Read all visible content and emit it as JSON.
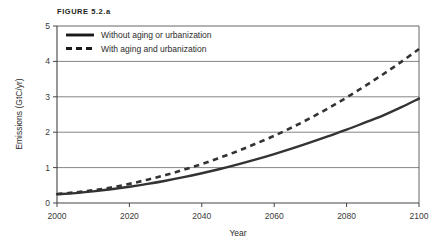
{
  "figure": {
    "title": "FIGURE 5.2.a"
  },
  "chart_data": {
    "type": "line",
    "title": "FIGURE 5.2.a",
    "xlabel": "Year",
    "ylabel": "Emissions (GtC/yr)",
    "xlim": [
      2000,
      2100
    ],
    "ylim": [
      0,
      5
    ],
    "xticks": [
      2000,
      2020,
      2040,
      2060,
      2080,
      2100
    ],
    "yticks": [
      0,
      1,
      2,
      3,
      4,
      5
    ],
    "grid": "horizontal",
    "legend_position": "top-left-inside",
    "series": [
      {
        "name": "Without aging or urbanization",
        "style": "solid",
        "color": "#333333",
        "x": [
          2000,
          2005,
          2010,
          2015,
          2020,
          2025,
          2030,
          2035,
          2040,
          2045,
          2050,
          2055,
          2060,
          2065,
          2070,
          2075,
          2080,
          2085,
          2090,
          2095,
          2100
        ],
        "values": [
          0.25,
          0.28,
          0.33,
          0.39,
          0.46,
          0.54,
          0.63,
          0.73,
          0.84,
          0.96,
          1.09,
          1.23,
          1.38,
          1.54,
          1.71,
          1.89,
          2.07,
          2.27,
          2.47,
          2.7,
          2.95
        ]
      },
      {
        "name": "With aging and urbanization",
        "style": "dashed",
        "color": "#333333",
        "x": [
          2000,
          2005,
          2010,
          2015,
          2020,
          2025,
          2030,
          2035,
          2040,
          2045,
          2050,
          2055,
          2060,
          2065,
          2070,
          2075,
          2080,
          2085,
          2090,
          2095,
          2100
        ],
        "values": [
          0.25,
          0.3,
          0.36,
          0.44,
          0.54,
          0.66,
          0.79,
          0.94,
          1.1,
          1.28,
          1.47,
          1.68,
          1.9,
          2.14,
          2.4,
          2.68,
          2.98,
          3.3,
          3.63,
          3.98,
          4.35
        ]
      }
    ],
    "legend": [
      {
        "label": "Without aging or urbanization",
        "style": "solid"
      },
      {
        "label": "With aging and urbanization",
        "style": "dashed"
      }
    ]
  }
}
